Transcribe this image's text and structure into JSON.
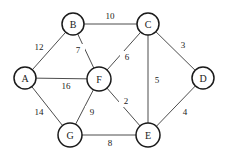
{
  "figure": {
    "background_color": "#ffffff",
    "node_stroke_color": "#1a1a1a",
    "edge_stroke_color": "#4d4d4d",
    "label_color": "#1a1a1a"
  },
  "chart_data": {
    "type": "diagram",
    "subtype": "weighted-undirected-graph",
    "title": "",
    "xlabel": "",
    "ylabel": "",
    "grid": false,
    "legend": null,
    "node_radius": 11,
    "nodes": [
      {
        "id": "A",
        "label": "A",
        "x": 25,
        "y": 78,
        "r": 11
      },
      {
        "id": "B",
        "label": "B",
        "x": 73,
        "y": 24,
        "r": 11
      },
      {
        "id": "C",
        "label": "C",
        "x": 148,
        "y": 24,
        "r": 11
      },
      {
        "id": "D",
        "label": "D",
        "x": 203,
        "y": 78,
        "r": 11
      },
      {
        "id": "E",
        "label": "E",
        "x": 148,
        "y": 135,
        "r": 12
      },
      {
        "id": "F",
        "label": "F",
        "x": 99,
        "y": 79,
        "r": 12
      },
      {
        "id": "G",
        "label": "G",
        "x": 70,
        "y": 135,
        "r": 12
      }
    ],
    "edges": [
      {
        "source": "A",
        "target": "B",
        "weight": 12,
        "label": "12",
        "lx": 39,
        "ly": 47
      },
      {
        "source": "B",
        "target": "C",
        "weight": 10,
        "label": "10",
        "lx": 110,
        "ly": 16
      },
      {
        "source": "B",
        "target": "F",
        "weight": 7,
        "label": "7",
        "lx": 78,
        "ly": 50
      },
      {
        "source": "A",
        "target": "F",
        "weight": 16,
        "label": "16",
        "lx": 66,
        "ly": 86
      },
      {
        "source": "A",
        "target": "G",
        "weight": 14,
        "label": "14",
        "lx": 39,
        "ly": 112
      },
      {
        "source": "C",
        "target": "F",
        "weight": 6,
        "label": "6",
        "lx": 127,
        "ly": 57
      },
      {
        "source": "C",
        "target": "E",
        "weight": 5,
        "label": "5",
        "lx": 157,
        "ly": 80
      },
      {
        "source": "C",
        "target": "D",
        "weight": 3,
        "label": "3",
        "lx": 183,
        "ly": 45
      },
      {
        "source": "D",
        "target": "E",
        "weight": 4,
        "label": "4",
        "lx": 185,
        "ly": 112
      },
      {
        "source": "F",
        "target": "E",
        "weight": 2,
        "label": "2",
        "lx": 126,
        "ly": 101
      },
      {
        "source": "F",
        "target": "G",
        "weight": 9,
        "label": "9",
        "lx": 92,
        "ly": 112
      },
      {
        "source": "G",
        "target": "E",
        "weight": 8,
        "label": "8",
        "lx": 110,
        "ly": 143
      }
    ]
  }
}
